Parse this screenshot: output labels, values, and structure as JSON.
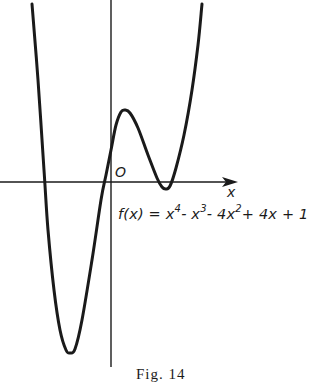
{
  "figure": {
    "caption": "Fig. 14",
    "origin_label": "O",
    "x_axis_label": "x",
    "equation": {
      "prefix": "f(x) = x",
      "exp1": "4",
      "mid1": "- x",
      "exp2": "3",
      "mid2": "- 4x",
      "exp3": "2",
      "suffix": "+ 4x + 1"
    },
    "colors": {
      "ink": "#1a1a1a",
      "background": "#ffffff"
    }
  },
  "chart_data": {
    "type": "line",
    "title": "",
    "function": "f(x) = x^4 - x^3 - 4x^2 + 4x + 1",
    "xlabel": "x",
    "ylabel": "",
    "grid": false,
    "legend": null,
    "annotations": [
      "O",
      "f(x) = x^4 - x^3 - 4x^2 + 4x + 1",
      "Fig. 14"
    ],
    "features": {
      "real_roots_approx": [
        -1.9,
        -0.2
      ],
      "local_max_approx": {
        "x": 0.5,
        "y": 2.3
      },
      "local_min_right_approx": {
        "x": 1.4,
        "y": -0.2
      },
      "global_min_approx": {
        "x": -1.4,
        "y": -5.7
      }
    },
    "pixel_path": [
      [
        32,
        4
      ],
      [
        38,
        80
      ],
      [
        44,
        170
      ],
      [
        48,
        230
      ],
      [
        54,
        290
      ],
      [
        60,
        330
      ],
      [
        66,
        350
      ],
      [
        70,
        353
      ],
      [
        75,
        349
      ],
      [
        82,
        320
      ],
      [
        92,
        260
      ],
      [
        101,
        200
      ],
      [
        106,
        175
      ],
      [
        111,
        150
      ],
      [
        116,
        125
      ],
      [
        121,
        112
      ],
      [
        125,
        110
      ],
      [
        130,
        113
      ],
      [
        138,
        128
      ],
      [
        148,
        155
      ],
      [
        157,
        178
      ],
      [
        162,
        187
      ],
      [
        166,
        189
      ],
      [
        170,
        186
      ],
      [
        176,
        168
      ],
      [
        184,
        135
      ],
      [
        192,
        90
      ],
      [
        198,
        45
      ],
      [
        202,
        4
      ]
    ]
  }
}
